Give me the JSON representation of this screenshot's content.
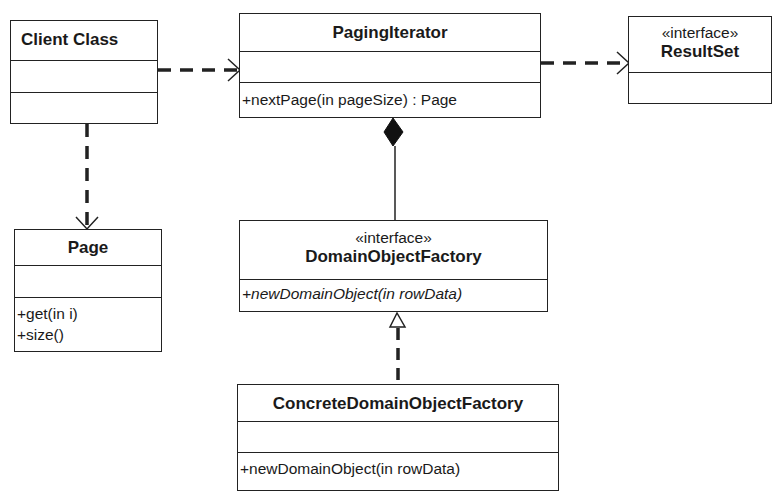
{
  "diagram": {
    "type": "uml-class-diagram",
    "classes": {
      "client": {
        "name": "Client Class",
        "stereotype": null,
        "attributes": [],
        "operations": []
      },
      "paging_iterator": {
        "name": "PagingIterator",
        "stereotype": null,
        "attributes": [],
        "operations": [
          "+nextPage(in pageSize) : Page"
        ]
      },
      "result_set": {
        "name": "ResultSet",
        "stereotype": "«interface»",
        "operations": []
      },
      "page": {
        "name": "Page",
        "stereotype": null,
        "attributes": [],
        "operations": [
          "+get(in i)",
          "+size()"
        ]
      },
      "domain_object_factory": {
        "name": "DomainObjectFactory",
        "stereotype": "«interface»",
        "operations": [
          "+newDomainObject(in rowData)"
        ],
        "operations_abstract": true
      },
      "concrete_domain_object_factory": {
        "name": "ConcreteDomainObjectFactory",
        "stereotype": null,
        "attributes": [],
        "operations": [
          "+newDomainObject(in rowData)"
        ]
      }
    },
    "relationships": [
      {
        "from": "Client Class",
        "to": "PagingIterator",
        "kind": "dependency",
        "line": "dashed",
        "arrow": "open"
      },
      {
        "from": "PagingIterator",
        "to": "ResultSet",
        "kind": "dependency",
        "line": "dashed",
        "arrow": "open"
      },
      {
        "from": "Client Class",
        "to": "Page",
        "kind": "dependency",
        "line": "dashed",
        "arrow": "open"
      },
      {
        "from": "PagingIterator",
        "to": "DomainObjectFactory",
        "kind": "composition",
        "line": "solid",
        "end": "filled-diamond"
      },
      {
        "from": "ConcreteDomainObjectFactory",
        "to": "DomainObjectFactory",
        "kind": "realization",
        "line": "dashed",
        "arrow": "hollow-triangle"
      }
    ],
    "colors": {
      "line": "#222222",
      "background": "#ffffff",
      "text": "#1a1a1a"
    }
  }
}
